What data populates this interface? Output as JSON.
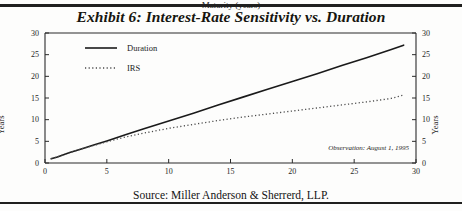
{
  "title": "Exhibit 6: Interest-Rate Sensitivity vs. Duration",
  "source": "Source: Miller Anderson & Sherrerd, LLP.",
  "annotation": "Observation:  August 1, 1995",
  "axes": {
    "y_left_label": "Years",
    "y_right_label": "Years",
    "x_label": "Maturity (years)"
  },
  "colors": {
    "rule": "#20201f",
    "duration_line": "#1a1a1a",
    "irs_line": "#4a4a4a",
    "axis": "#2b2b2b",
    "text": "#16150f",
    "background": "#fdfdfc"
  },
  "chart_data": {
    "type": "line",
    "title": "Exhibit 6: Interest-Rate Sensitivity vs. Duration",
    "xlabel": "Maturity (years)",
    "ylabel": "Years",
    "y2label": "Years",
    "xlim": [
      0,
      30
    ],
    "ylim": [
      0,
      30
    ],
    "xticks": [
      0,
      5,
      10,
      15,
      20,
      25,
      30
    ],
    "yticks": [
      0,
      5,
      10,
      15,
      20,
      25,
      30
    ],
    "y2ticks": [
      0,
      5,
      10,
      15,
      20,
      25,
      30
    ],
    "grid": false,
    "legend_position": "upper left",
    "annotations": [
      "Observation:  August 1, 1995"
    ],
    "x": [
      0.5,
      1,
      2,
      3,
      4,
      5,
      6.5,
      8,
      10,
      12,
      14,
      16,
      18,
      20,
      22,
      24,
      26,
      28,
      29
    ],
    "series": [
      {
        "name": "Duration",
        "style": "solid",
        "values": [
          1.0,
          1.4,
          2.4,
          3.3,
          4.2,
          5.1,
          6.5,
          7.9,
          9.7,
          11.5,
          13.4,
          15.2,
          17.0,
          18.8,
          20.6,
          22.5,
          24.3,
          26.2,
          27.2
        ]
      },
      {
        "name": "IRS",
        "style": "dotted",
        "values": [
          1.0,
          1.4,
          2.4,
          3.3,
          4.1,
          4.9,
          6.0,
          6.9,
          8.0,
          8.9,
          9.8,
          10.6,
          11.3,
          12.0,
          12.7,
          13.4,
          14.1,
          14.9,
          15.7
        ]
      }
    ],
    "legend": [
      {
        "label": "Duration",
        "style": "solid"
      },
      {
        "label": "IRS",
        "style": "dotted"
      }
    ]
  }
}
